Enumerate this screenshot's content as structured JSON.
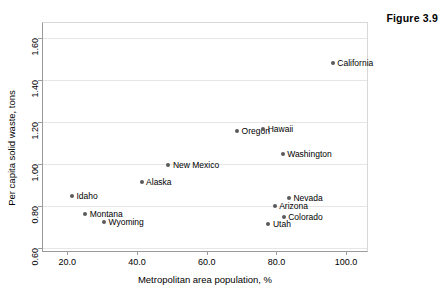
{
  "figure": {
    "label": "Figure 3.9"
  },
  "chart_data": {
    "type": "scatter",
    "title": "Figure 3.9",
    "xlabel": "Metropolitan area population, %",
    "ylabel": "Per capita solid waste, tons",
    "xlim": [
      13.0,
      106.0
    ],
    "ylim": [
      0.585,
      1.67
    ],
    "xticks": [
      "20.0",
      "40.0",
      "60.0",
      "80.0",
      "100.0"
    ],
    "xtick_values": [
      20.0,
      40.0,
      60.0,
      80.0,
      100.0
    ],
    "yticks": [
      "0.60",
      "0.80",
      "1.00",
      "1.20",
      "1.40",
      "1.60"
    ],
    "ytick_values": [
      0.6,
      0.8,
      1.0,
      1.2,
      1.4,
      1.6
    ],
    "grid": "horizontal",
    "legend": "none",
    "marker_color": "#5a5a5a",
    "points": [
      {
        "label": "California",
        "x": 96.2,
        "y": 1.48,
        "label_side": "right"
      },
      {
        "label": "Oregon",
        "x": 68.7,
        "y": 1.155,
        "label_side": "right"
      },
      {
        "label": "Hawaii",
        "x": 76.2,
        "y": 1.165,
        "label_side": "right"
      },
      {
        "label": "Washington",
        "x": 81.8,
        "y": 1.045,
        "label_side": "right"
      },
      {
        "label": "New Mexico",
        "x": 49.0,
        "y": 0.993,
        "label_side": "right"
      },
      {
        "label": "Alaska",
        "x": 41.3,
        "y": 0.913,
        "label_side": "right"
      },
      {
        "label": "Idaho",
        "x": 21.3,
        "y": 0.845,
        "label_side": "right"
      },
      {
        "label": "Nevada",
        "x": 83.6,
        "y": 0.838,
        "label_side": "right"
      },
      {
        "label": "Arizona",
        "x": 79.5,
        "y": 0.798,
        "label_side": "right"
      },
      {
        "label": "Montana",
        "x": 25.1,
        "y": 0.763,
        "label_side": "right"
      },
      {
        "label": "Colorado",
        "x": 82.1,
        "y": 0.748,
        "label_side": "right"
      },
      {
        "label": "Wyoming",
        "x": 30.5,
        "y": 0.725,
        "label_side": "right"
      },
      {
        "label": "Utah",
        "x": 77.7,
        "y": 0.713,
        "label_side": "right"
      }
    ]
  }
}
